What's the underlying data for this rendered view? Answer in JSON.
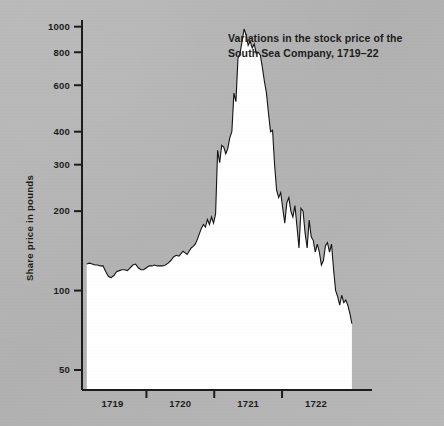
{
  "chart_data": {
    "type": "area",
    "title": "Variations in the stock price of the South Sea Company, 1719–22",
    "title_line1": "Variations in the stock price of the",
    "title_line2": "South Sea Company, 1719–22",
    "xlabel": "",
    "ylabel": "Share price in pounds",
    "yscale": "log",
    "ylim": [
      42,
      1060
    ],
    "ytick_labels": [
      "50",
      "100",
      "200",
      "300",
      "400",
      "600",
      "800",
      "1000"
    ],
    "yticks": [
      50,
      100,
      200,
      300,
      400,
      600,
      800,
      1000
    ],
    "xtick_labels": [
      "1719",
      "1720",
      "1721",
      "1722"
    ],
    "xticks": [
      1719,
      1720,
      1721,
      1722
    ],
    "xlim": [
      1718.55,
      1722.62
    ],
    "grid": false,
    "legend": null,
    "fill_color": "#ffffff",
    "line_color": "#141414",
    "background_color": "#b4b4b4",
    "series": [
      {
        "name": "South Sea Company share price",
        "x": [
          1718.62,
          1718.66,
          1718.7,
          1718.74,
          1718.78,
          1718.82,
          1718.86,
          1718.9,
          1718.94,
          1718.98,
          1719.02,
          1719.06,
          1719.1,
          1719.14,
          1719.18,
          1719.22,
          1719.26,
          1719.3,
          1719.34,
          1719.38,
          1719.42,
          1719.46,
          1719.5,
          1719.54,
          1719.58,
          1719.62,
          1719.66,
          1719.7,
          1719.74,
          1719.78,
          1719.82,
          1719.86,
          1719.9,
          1719.94,
          1719.98,
          1720.01,
          1720.04,
          1720.07,
          1720.1,
          1720.13,
          1720.16,
          1720.19,
          1720.22,
          1720.25,
          1720.28,
          1720.31,
          1720.34,
          1720.37,
          1720.4,
          1720.43,
          1720.46,
          1720.49,
          1720.52,
          1720.55,
          1720.58,
          1720.61,
          1720.64,
          1720.67,
          1720.7,
          1720.73,
          1720.76,
          1720.79,
          1720.82,
          1720.85,
          1720.88,
          1720.91,
          1720.94,
          1720.97,
          1721.0,
          1721.03,
          1721.06,
          1721.09,
          1721.12,
          1721.15,
          1721.18,
          1721.21,
          1721.24,
          1721.27,
          1721.3,
          1721.33,
          1721.36,
          1721.39,
          1721.42,
          1721.45,
          1721.48,
          1721.51,
          1721.54,
          1721.57,
          1721.6,
          1721.63,
          1721.66,
          1721.69,
          1721.72,
          1721.75,
          1721.78,
          1721.81,
          1721.84,
          1721.87,
          1721.9,
          1721.93,
          1721.96,
          1721.99,
          1722.02,
          1722.05,
          1722.08,
          1722.11,
          1722.14,
          1722.17,
          1722.2,
          1722.23,
          1722.26,
          1722.29,
          1722.32,
          1722.35,
          1722.38,
          1722.41,
          1722.44,
          1722.47,
          1722.5,
          1722.53
        ],
        "values": [
          126,
          127,
          126,
          125,
          125,
          124,
          124,
          118,
          113,
          112,
          114,
          118,
          119,
          120,
          120,
          119,
          122,
          125,
          126,
          122,
          120,
          120,
          122,
          124,
          124,
          125,
          124,
          124,
          124,
          125,
          127,
          130,
          134,
          136,
          135,
          138,
          141,
          139,
          137,
          141,
          145,
          147,
          150,
          156,
          164,
          172,
          178,
          174,
          186,
          178,
          190,
          180,
          195,
          340,
          305,
          355,
          350,
          330,
          345,
          380,
          400,
          560,
          520,
          760,
          790,
          880,
          980,
          930,
          850,
          880,
          830,
          860,
          790,
          800,
          780,
          700,
          620,
          560,
          470,
          400,
          405,
          300,
          240,
          225,
          235,
          205,
          180,
          215,
          225,
          200,
          190,
          210,
          175,
          145,
          205,
          200,
          165,
          145,
          185,
          160,
          155,
          140,
          150,
          140,
          125,
          130,
          148,
          152,
          140,
          150,
          120,
          100,
          95,
          88,
          96,
          90,
          92,
          88,
          82,
          75
        ]
      }
    ]
  },
  "axes": {
    "y_axis_label": "Share price in pounds",
    "y_tick_values": [
      "1000",
      "800",
      "600",
      "400",
      "300",
      "200",
      "100",
      "50"
    ],
    "x_tick_values": [
      "1719",
      "1720",
      "1721",
      "1722"
    ]
  },
  "annotations": {
    "title_line1": "Variations in the stock price of the",
    "title_line2": "South Sea Company, 1719–22"
  },
  "colors": {
    "background": "#b4b4b4",
    "area_fill": "#ffffff",
    "line": "#141414",
    "text": "#1c1c1c"
  }
}
